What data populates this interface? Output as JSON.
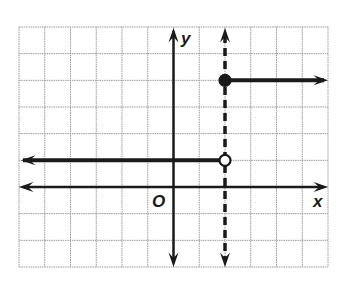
{
  "chart_data": {
    "type": "line",
    "title": "",
    "xlabel": "x",
    "ylabel": "y",
    "origin_label": "O",
    "xlim": [
      -6,
      6
    ],
    "ylim": [
      -3,
      6
    ],
    "grid": true,
    "legend": null,
    "series": [
      {
        "name": "left-ray",
        "kind": "ray",
        "from": [
          2,
          1
        ],
        "direction": "left",
        "endpoint": "open",
        "y": 1
      },
      {
        "name": "right-ray",
        "kind": "ray",
        "from": [
          2,
          4
        ],
        "direction": "right",
        "endpoint": "closed",
        "y": 4
      },
      {
        "name": "vertical-asymptote-like-dashed",
        "kind": "dashed-line",
        "x": 2,
        "direction": "both"
      }
    ],
    "points": [
      {
        "x": 2,
        "y": 1,
        "style": "open"
      },
      {
        "x": 2,
        "y": 4,
        "style": "closed"
      }
    ]
  },
  "labels": {
    "x": "x",
    "y": "y",
    "origin": "O"
  }
}
